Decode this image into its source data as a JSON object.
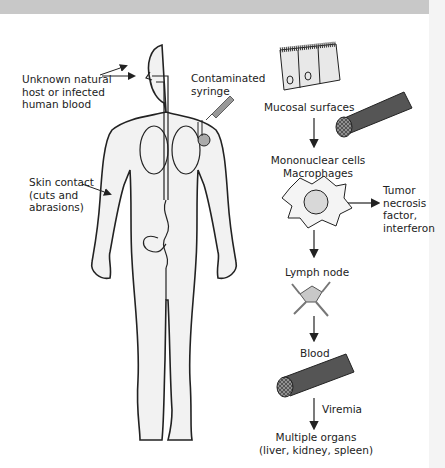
{
  "diagram": {
    "route_labels": {
      "natural_host": [
        "Unknown natural",
        "host or infected",
        "human blood"
      ],
      "syringe": [
        "Contaminated",
        "syringe"
      ],
      "skin_contact": [
        "Skin contact",
        "(cuts and",
        "abrasions)"
      ]
    },
    "pathway": {
      "mucosal": "Mucosal surfaces",
      "mononuclear": [
        "Mononuclear cells",
        "Macrophages"
      ],
      "cytokines": [
        "Tumor",
        "necrosis",
        "factor,",
        "interferon"
      ],
      "lymph": "Lymph node",
      "blood": "Blood",
      "viremia": "Viremia",
      "organs": [
        "Multiple organs",
        "(liver, kidney, spleen)"
      ]
    },
    "colors": {
      "body_fill": "#f2f2f2",
      "outline": "#222222",
      "vessel": "#5a5a5a",
      "cell_fill": "#d8d8d8"
    }
  }
}
